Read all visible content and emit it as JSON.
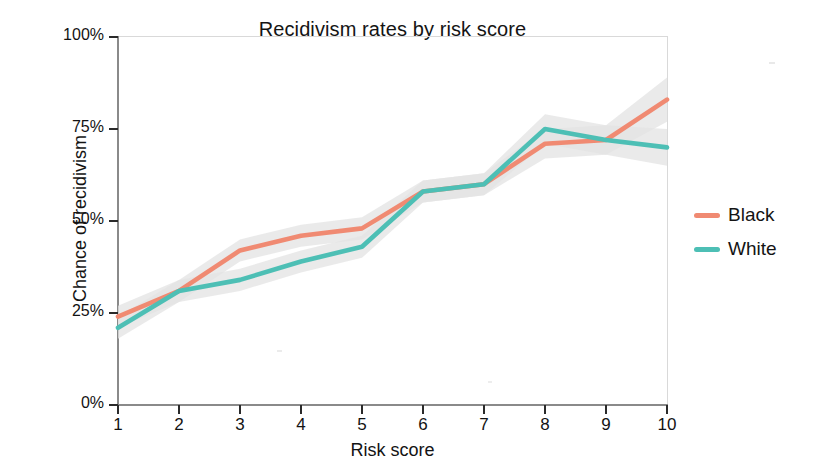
{
  "chart_data": {
    "type": "line",
    "title": "Recidivism rates by risk score",
    "xlabel": "Risk score",
    "ylabel": "Chance of recidivism",
    "x": [
      1,
      2,
      3,
      4,
      5,
      6,
      7,
      8,
      9,
      10
    ],
    "xtick_labels": [
      "1",
      "2",
      "3",
      "4",
      "5",
      "6",
      "7",
      "8",
      "9",
      "10"
    ],
    "ytick_labels": [
      "0%",
      "25%",
      "50%",
      "75%",
      "100%"
    ],
    "ytick_values": [
      0,
      25,
      50,
      75,
      100
    ],
    "xlim": [
      1,
      10
    ],
    "ylim": [
      0,
      100
    ],
    "grid": false,
    "legend_position": "right",
    "confidence_band": true,
    "series": [
      {
        "name": "Black",
        "color": "#f08a72",
        "values": [
          24,
          31,
          42,
          46,
          48,
          58,
          60,
          71,
          72,
          83
        ],
        "band_low": [
          21,
          28,
          39,
          43,
          45,
          55,
          57,
          67,
          68,
          77
        ],
        "band_high": [
          27,
          34,
          45,
          49,
          51,
          61,
          63,
          75,
          76,
          89
        ]
      },
      {
        "name": "White",
        "color": "#4dbfb5",
        "values": [
          21,
          31,
          34,
          39,
          43,
          58,
          60,
          75,
          72,
          70
        ],
        "band_low": [
          18,
          28,
          31,
          36,
          40,
          55,
          57,
          71,
          68,
          65
        ],
        "band_high": [
          24,
          34,
          37,
          42,
          46,
          61,
          63,
          79,
          76,
          75
        ]
      }
    ],
    "band_color": "#e3e3e3"
  },
  "legend": {
    "items": [
      {
        "label": "Black",
        "color": "#f08a72"
      },
      {
        "label": "White",
        "color": "#4dbfb5"
      }
    ]
  },
  "axes": {
    "y_ticks": [
      {
        "label": "100%",
        "value": 100
      },
      {
        "label": "75%",
        "value": 75
      },
      {
        "label": "50%",
        "value": 50
      },
      {
        "label": "25%",
        "value": 25
      },
      {
        "label": "0%",
        "value": 0
      }
    ],
    "x_ticks": [
      {
        "label": "1",
        "value": 1
      },
      {
        "label": "2",
        "value": 2
      },
      {
        "label": "3",
        "value": 3
      },
      {
        "label": "4",
        "value": 4
      },
      {
        "label": "5",
        "value": 5
      },
      {
        "label": "6",
        "value": 6
      },
      {
        "label": "7",
        "value": 7
      },
      {
        "label": "8",
        "value": 8
      },
      {
        "label": "9",
        "value": 9
      },
      {
        "label": "10",
        "value": 10
      }
    ]
  }
}
